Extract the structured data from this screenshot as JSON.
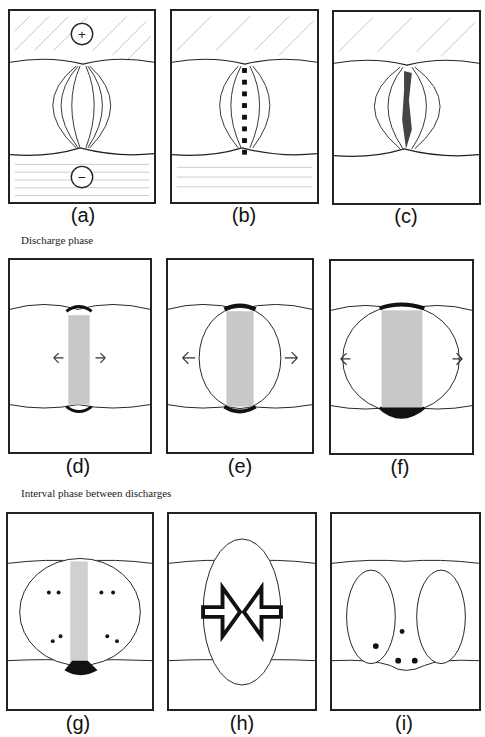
{
  "figure": {
    "phases": [
      {
        "id": "discharge",
        "label": "Discharge phase"
      },
      {
        "id": "interval",
        "label": "Interval phase between discharges"
      }
    ],
    "panels": [
      {
        "id": "a",
        "caption": "(a)",
        "description": "Field lines between + and - electrodes",
        "symbols": {
          "top": "+",
          "bottom": "−"
        }
      },
      {
        "id": "b",
        "caption": "(b)",
        "description": "Field lines with streamer channel forming"
      },
      {
        "id": "c",
        "caption": "(c)",
        "description": "Field lines with dark discharge channel"
      },
      {
        "id": "d",
        "caption": "(d)",
        "description": "Narrow discharge channel expanding"
      },
      {
        "id": "e",
        "caption": "(e)",
        "description": "Channel widening, bubble expanding"
      },
      {
        "id": "f",
        "caption": "(f)",
        "description": "Wide channel, bubble expanding further"
      },
      {
        "id": "g",
        "caption": "(g)",
        "description": "Bubble contracting with residual channel"
      },
      {
        "id": "h",
        "caption": "(h)",
        "description": "Bubble collapsing inward"
      },
      {
        "id": "i",
        "caption": "(i)",
        "description": "Bubble split into two lobes"
      }
    ]
  },
  "colors": {
    "ink": "#222222",
    "channel": "#c8c8c8",
    "bg": "#ffffff"
  }
}
